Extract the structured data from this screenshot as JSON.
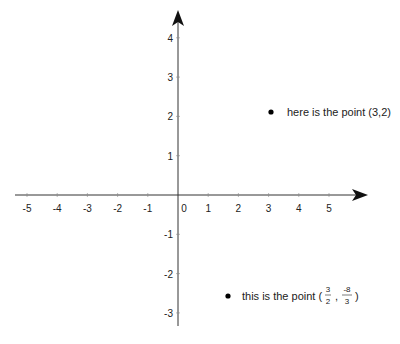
{
  "chart_data": {
    "type": "scatter",
    "title": "",
    "xlabel": "",
    "ylabel": "",
    "xlim": [
      -5.5,
      6.3
    ],
    "ylim": [
      -3.4,
      4.6
    ],
    "grid": false,
    "x_ticks": [
      "-5",
      "-4",
      "-3",
      "-2",
      "-1",
      "0",
      "1",
      "2",
      "3",
      "4",
      "5"
    ],
    "y_ticks": [
      "4",
      "3",
      "2",
      "1",
      "-1",
      "-2",
      "-3"
    ],
    "points": [
      {
        "x": 3,
        "y": 2,
        "annotation": "here is the point (3,2)"
      },
      {
        "x": 1.5,
        "y": -2.667,
        "annotation": "this is the point (3/2, -8/3)"
      }
    ]
  },
  "labels": {
    "point1": "here is the point (3,2)",
    "point2_prefix": "this is the point (",
    "point2_xnum": "3",
    "point2_xden": "2",
    "point2_sep": ",",
    "point2_ynum": "-8",
    "point2_yden": "3",
    "point2_suffix": ")"
  }
}
